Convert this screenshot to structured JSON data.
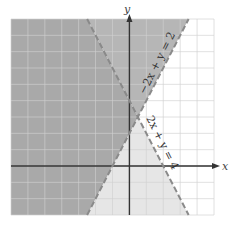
{
  "chart_data": {
    "type": "inequality-region",
    "title": "",
    "xlabel": "x",
    "ylabel": "y",
    "xlim": [
      -7,
      5
    ],
    "ylim": [
      -3,
      9
    ],
    "grid": true,
    "grid_step": 1,
    "lines": [
      {
        "equation": "-2x + y = 2",
        "slope": 2,
        "intercept": 2,
        "style": "dashed",
        "label": "−2x + y = 2",
        "shade": "above"
      },
      {
        "equation": "2x + y = 4",
        "slope": -2,
        "intercept": 4,
        "style": "dashed",
        "label": "2x + y = 4",
        "shade": "below"
      }
    ],
    "intersection": {
      "x": 0.5,
      "y": 3
    },
    "regions": [
      {
        "name": "overlap",
        "description": "y ≥ 2x + 2 and y ≤ -2x + 4",
        "color": "#a9a9a9"
      },
      {
        "name": "first-only",
        "description": "y ≥ 2x + 2 only",
        "color": "#b6b6b6"
      },
      {
        "name": "second-only",
        "description": "y ≤ -2x + 4 only",
        "color": "#e6e6e6"
      }
    ]
  },
  "labels": {
    "x_axis": "x",
    "y_axis": "y",
    "line1": "−2x + y = 2",
    "line2": "2x + y = 4"
  },
  "colors": {
    "overlap": "#a9a9a9",
    "first_only": "#b6b6b6",
    "second_only": "#e6e6e6",
    "grid": "#d0d0d0",
    "axis": "#333333",
    "boundary": "#8a8a8a"
  }
}
